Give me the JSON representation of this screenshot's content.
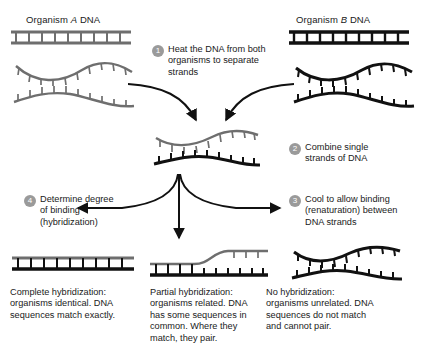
{
  "figure": {
    "type": "dna-hybridization-diagram",
    "background": "#ffffff",
    "organism_a_color": "#6e6e6e",
    "organism_b_color": "#111111",
    "badge_color": "#9a9a9a"
  },
  "headers": {
    "organism_a": {
      "prefix": "Organism ",
      "italic": "A",
      "suffix": " DNA"
    },
    "organism_b": {
      "prefix": "Organism ",
      "italic": "B",
      "suffix": " DNA"
    }
  },
  "steps": [
    {
      "number": "1",
      "lines": [
        "Heat the DNA from both",
        "organisms to separate",
        "strands"
      ]
    },
    {
      "number": "2",
      "lines": [
        "Combine single",
        "strands of DNA"
      ]
    },
    {
      "number": "3",
      "lines": [
        "Cool to allow binding",
        "(renaturation) between",
        "DNA strands"
      ]
    },
    {
      "number": "4",
      "lines": [
        "Determine degree",
        "of binding",
        "(hybridization)"
      ]
    }
  ],
  "outcomes": [
    {
      "id": "complete",
      "lines": [
        "Complete hybridization:",
        "organisms identical. DNA",
        "sequences match exactly."
      ]
    },
    {
      "id": "partial",
      "lines": [
        "Partial hybridization:",
        "organisms related. DNA",
        "has some sequences in",
        "common.  Where they",
        "match, they pair."
      ]
    },
    {
      "id": "none",
      "lines": [
        "No hybridization:",
        "organisms unrelated. DNA",
        "sequences do not match",
        "and cannot pair."
      ]
    }
  ]
}
